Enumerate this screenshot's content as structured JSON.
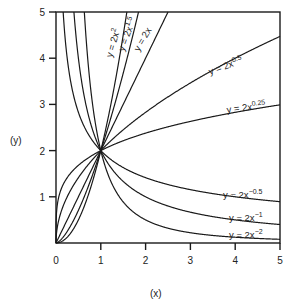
{
  "chart_data": {
    "type": "line",
    "title": "",
    "xlabel": "(x)",
    "ylabel": "(y)",
    "xlim": [
      0,
      5
    ],
    "ylim": [
      0,
      5
    ],
    "x_ticks": [
      "0",
      "1",
      "2",
      "3",
      "4",
      "5"
    ],
    "y_ticks": [
      "1",
      "2",
      "3",
      "4",
      "5"
    ],
    "grid": false,
    "legend": "inline labels on curves",
    "series": [
      {
        "name": "y = 2x^2",
        "label": "y = 2x",
        "exp_label": "2",
        "coefficient": 2,
        "exponent": 2
      },
      {
        "name": "y = 2x^1.5",
        "label": "y = 2x",
        "exp_label": "1.5",
        "coefficient": 2,
        "exponent": 1.5
      },
      {
        "name": "y = 2x",
        "label": "y = 2x",
        "exp_label": "",
        "coefficient": 2,
        "exponent": 1
      },
      {
        "name": "y = 2x^0.5",
        "label": "y = 2x",
        "exp_label": "0.5",
        "coefficient": 2,
        "exponent": 0.5
      },
      {
        "name": "y = 2x^0.25",
        "label": "y = 2x",
        "exp_label": "0.25",
        "coefficient": 2,
        "exponent": 0.25
      },
      {
        "name": "y = 2x^-0.5",
        "label": "y = 2x",
        "exp_label": "−0.5",
        "coefficient": 2,
        "exponent": -0.5
      },
      {
        "name": "y = 2x^-1",
        "label": "y = 2x",
        "exp_label": "−1",
        "coefficient": 2,
        "exponent": -1
      },
      {
        "name": "y = 2x^-2",
        "label": "y = 2x",
        "exp_label": "−2",
        "coefficient": 2,
        "exponent": -2
      }
    ],
    "annotations": [
      "All curves pass through (1, 2)"
    ]
  }
}
